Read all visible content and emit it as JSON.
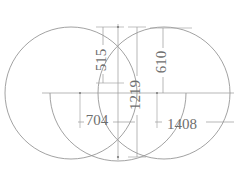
{
  "drawing": {
    "title": "Overlapping Circles Dimensioned Sketch",
    "units": "mm",
    "stroke_color": "#8a8a8a",
    "dimension_color": "#9a9a9a",
    "text_color": "#6e6e6e",
    "background_color": "#ffffff",
    "width_px": 240,
    "height_px": 179
  },
  "shapes": {
    "circles": [
      {
        "name": "left-circle",
        "cx": 71,
        "cy": 93,
        "r": 66
      },
      {
        "name": "right-circle",
        "cx": 164,
        "cy": 93,
        "r": 66
      },
      {
        "name": "lower-arc",
        "cx": 118,
        "cy": 93,
        "r": 68
      }
    ]
  },
  "dimensions": [
    {
      "id": "dim-515",
      "value": "515",
      "orientation": "vertical",
      "x": 103,
      "y_start": 27,
      "y_end": 83,
      "label_x": 103,
      "label_y": 60
    },
    {
      "id": "dim-610",
      "value": "610",
      "orientation": "vertical",
      "x": 163,
      "y_start": 28,
      "y_end": 93,
      "label_x": 163,
      "label_y": 62
    },
    {
      "id": "dim-1219",
      "value": "1219",
      "orientation": "vertical",
      "x": 137,
      "y_start": 27,
      "y_end": 157,
      "label_x": 137,
      "label_y": 95
    },
    {
      "id": "dim-704",
      "value": "704",
      "orientation": "horizontal",
      "y": 122,
      "x_start": 80,
      "x_end": 118,
      "label_x": 97,
      "label_y": 122
    },
    {
      "id": "dim-1408",
      "value": "1408",
      "orientation": "horizontal",
      "y": 122,
      "x_start": 157,
      "x_end": 232,
      "label_x": 182,
      "label_y": 126
    }
  ],
  "axes": {
    "horizontal_centerline": {
      "y": 93,
      "x_start": 42,
      "x_end": 234
    },
    "vertical_centerline": {
      "x": 118,
      "y_start": 24,
      "y_end": 160
    }
  },
  "nodes": [
    {
      "name": "top-intersection",
      "x": 118,
      "y": 27
    },
    {
      "name": "bottom-intersection",
      "x": 118,
      "y": 157
    },
    {
      "name": "left-arc-node",
      "x": 80,
      "y": 93
    },
    {
      "name": "right-arc-node",
      "x": 157,
      "y": 93
    }
  ]
}
